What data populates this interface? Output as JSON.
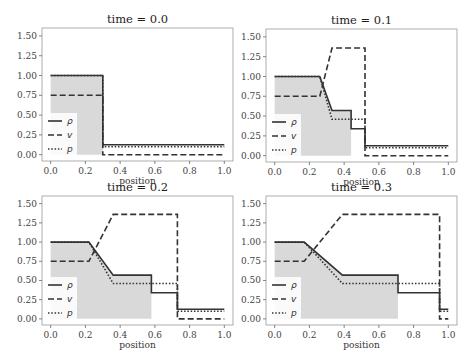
{
  "chart_data": [
    {
      "type": "line",
      "title": "time = 0.0",
      "xlabel": "position",
      "ylabel": "",
      "xlim": [
        -0.05,
        1.05
      ],
      "ylim": [
        -0.08,
        1.6
      ],
      "xticks": [
        "0.0",
        "0.2",
        "0.4",
        "0.6",
        "0.8",
        "1.0"
      ],
      "yticks": [
        "0.00",
        "0.25",
        "0.50",
        "0.75",
        "1.00",
        "1.25",
        "1.50"
      ],
      "grid": false,
      "legend_position": "lower left",
      "series": [
        {
          "name": "ρ",
          "style": "solid",
          "x": [
            0.0,
            0.3,
            0.3,
            1.0
          ],
          "y": [
            1.0,
            1.0,
            0.125,
            0.125
          ]
        },
        {
          "name": "v",
          "style": "dashed",
          "x": [
            0.0,
            0.3,
            0.3,
            1.0
          ],
          "y": [
            0.75,
            0.75,
            0.0,
            0.0
          ]
        },
        {
          "name": "p",
          "style": "dotted",
          "x": [
            0.0,
            0.3,
            0.3,
            1.0
          ],
          "y": [
            1.0,
            1.0,
            0.1,
            0.1
          ]
        }
      ],
      "fill": {
        "x_end": 0.3,
        "y_top": 1.0
      }
    },
    {
      "type": "line",
      "title": "time = 0.1",
      "xlabel": "position",
      "ylabel": "",
      "xlim": [
        -0.05,
        1.05
      ],
      "ylim": [
        -0.08,
        1.6
      ],
      "xticks": [
        "0.0",
        "0.2",
        "0.4",
        "0.6",
        "0.8",
        "1.0"
      ],
      "yticks": [
        "0.00",
        "0.25",
        "0.50",
        "0.75",
        "1.00",
        "1.25",
        "1.50"
      ],
      "grid": false,
      "legend_position": "lower left",
      "series": [
        {
          "name": "ρ",
          "style": "solid",
          "x": [
            0.0,
            0.26,
            0.33,
            0.44,
            0.44,
            0.52,
            0.52,
            1.0
          ],
          "y": [
            1.0,
            1.0,
            0.57,
            0.57,
            0.34,
            0.34,
            0.125,
            0.125
          ]
        },
        {
          "name": "v",
          "style": "dashed",
          "x": [
            0.0,
            0.26,
            0.33,
            0.52,
            0.52,
            1.0
          ],
          "y": [
            0.75,
            0.75,
            1.36,
            1.36,
            0.0,
            0.0
          ]
        },
        {
          "name": "p",
          "style": "dotted",
          "x": [
            0.0,
            0.26,
            0.33,
            0.52,
            0.52,
            1.0
          ],
          "y": [
            1.0,
            1.0,
            0.46,
            0.46,
            0.1,
            0.1
          ]
        }
      ],
      "fill": {
        "x_end": 0.44
      }
    },
    {
      "type": "line",
      "title": "time = 0.2",
      "xlabel": "position",
      "ylabel": "",
      "xlim": [
        -0.05,
        1.05
      ],
      "ylim": [
        -0.08,
        1.6
      ],
      "xticks": [
        "0.0",
        "0.2",
        "0.4",
        "0.6",
        "0.8",
        "1.0"
      ],
      "yticks": [
        "0.00",
        "0.25",
        "0.50",
        "0.75",
        "1.00",
        "1.25",
        "1.50"
      ],
      "grid": false,
      "legend_position": "lower left",
      "series": [
        {
          "name": "ρ",
          "style": "solid",
          "x": [
            0.0,
            0.22,
            0.36,
            0.58,
            0.58,
            0.73,
            0.73,
            1.0
          ],
          "y": [
            1.0,
            1.0,
            0.57,
            0.57,
            0.34,
            0.34,
            0.125,
            0.125
          ]
        },
        {
          "name": "v",
          "style": "dashed",
          "x": [
            0.0,
            0.22,
            0.36,
            0.73,
            0.73,
            1.0
          ],
          "y": [
            0.75,
            0.75,
            1.36,
            1.36,
            0.0,
            0.0
          ]
        },
        {
          "name": "p",
          "style": "dotted",
          "x": [
            0.0,
            0.22,
            0.36,
            0.73,
            0.73,
            1.0
          ],
          "y": [
            1.0,
            1.0,
            0.46,
            0.46,
            0.1,
            0.1
          ]
        }
      ],
      "fill": {
        "x_end": 0.58
      }
    },
    {
      "type": "line",
      "title": "time = 0.3",
      "xlabel": "position",
      "ylabel": "",
      "xlim": [
        -0.05,
        1.05
      ],
      "ylim": [
        -0.08,
        1.6
      ],
      "xticks": [
        "0.0",
        "0.2",
        "0.4",
        "0.6",
        "0.8",
        "1.0"
      ],
      "yticks": [
        "0.00",
        "0.25",
        "0.50",
        "0.75",
        "1.00",
        "1.25",
        "1.50"
      ],
      "grid": false,
      "legend_position": "lower left",
      "series": [
        {
          "name": "ρ",
          "style": "solid",
          "x": [
            0.0,
            0.17,
            0.39,
            0.71,
            0.71,
            0.95,
            0.95,
            1.0
          ],
          "y": [
            1.0,
            1.0,
            0.57,
            0.57,
            0.34,
            0.34,
            0.125,
            0.125
          ]
        },
        {
          "name": "v",
          "style": "dashed",
          "x": [
            0.0,
            0.17,
            0.39,
            0.95,
            0.95,
            1.0
          ],
          "y": [
            0.75,
            0.75,
            1.36,
            1.36,
            0.0,
            0.0
          ]
        },
        {
          "name": "p",
          "style": "dotted",
          "x": [
            0.0,
            0.17,
            0.39,
            0.95,
            0.95,
            1.0
          ],
          "y": [
            1.0,
            1.0,
            0.46,
            0.46,
            0.1,
            0.1
          ]
        }
      ],
      "fill": {
        "x_end": 0.71
      }
    }
  ],
  "legend": {
    "rho": "ρ",
    "v": "v",
    "p": "p"
  },
  "colors": {
    "line": "#333333",
    "fill": "#d9d9d9",
    "axes": "#999999"
  }
}
